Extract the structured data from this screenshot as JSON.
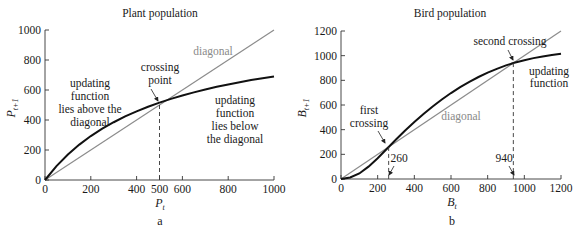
{
  "colors": {
    "curve": "#111111",
    "diagonal": "#8c8c8c",
    "axis": "#333333",
    "dashed": "#333333"
  },
  "chart_data": [
    {
      "type": "line",
      "panel": "a",
      "title": "Plant population",
      "xlabel": "P_t",
      "xlabel_main": "P",
      "xlabel_sub": "t",
      "ylabel": "P_{t+1}",
      "ylabel_main": "P",
      "ylabel_sub": "t+1",
      "xlim": [
        0,
        1000
      ],
      "ylim": [
        0,
        1000
      ],
      "xticks": [
        0,
        200,
        400,
        500,
        600,
        800,
        1000
      ],
      "yticks": [
        0,
        200,
        400,
        600,
        800,
        1000
      ],
      "grid": false,
      "series": [
        {
          "name": "updating function",
          "x": [
            0,
            50,
            100,
            150,
            200,
            250,
            300,
            350,
            400,
            450,
            500,
            550,
            600,
            650,
            700,
            750,
            800,
            850,
            900,
            950,
            1000
          ],
          "values": [
            0,
            93,
            170,
            236,
            293,
            342,
            385,
            424,
            458,
            488,
            516,
            541,
            563,
            584,
            603,
            621,
            637,
            652,
            666,
            678,
            690
          ]
        },
        {
          "name": "diagonal",
          "x": [
            0,
            1000
          ],
          "values": [
            0,
            1000
          ]
        }
      ],
      "crossings": [
        {
          "x": 500,
          "y": 500,
          "label": "crossing point"
        }
      ],
      "annotations": {
        "diagonal": "diagonal",
        "crossing": [
          "crossing",
          "point"
        ],
        "above": [
          "updating",
          "function",
          "lies above the",
          "diagonal"
        ],
        "below": [
          "updating",
          "function",
          "lies below",
          "the diagonal"
        ]
      },
      "panel_label": "a"
    },
    {
      "type": "line",
      "panel": "b",
      "title": "Bird population",
      "xlabel": "B_t",
      "xlabel_main": "B",
      "xlabel_sub": "t",
      "ylabel": "B_{t+1}",
      "ylabel_main": "B",
      "ylabel_sub": "t+1",
      "xlim": [
        0,
        1200
      ],
      "ylim": [
        0,
        1200
      ],
      "xticks": [
        0,
        200,
        400,
        600,
        800,
        1000,
        1200
      ],
      "yticks": [
        0,
        200,
        400,
        600,
        800,
        1000,
        1200
      ],
      "grid": false,
      "series": [
        {
          "name": "updating function",
          "x": [
            0,
            50,
            100,
            150,
            200,
            260,
            300,
            350,
            400,
            450,
            500,
            550,
            600,
            650,
            700,
            750,
            800,
            850,
            900,
            940,
            1000,
            1050,
            1100,
            1150,
            1200
          ],
          "values": [
            0,
            12,
            45,
            100,
            168,
            260,
            320,
            393,
            462,
            527,
            588,
            645,
            697,
            745,
            788,
            827,
            862,
            893,
            921,
            940,
            963,
            980,
            994,
            1005,
            1015
          ]
        },
        {
          "name": "diagonal",
          "x": [
            0,
            1200
          ],
          "values": [
            0,
            1200
          ]
        }
      ],
      "crossings": [
        {
          "x": 260,
          "y": 260,
          "label": "first crossing"
        },
        {
          "x": 940,
          "y": 940,
          "label": "second crossing"
        }
      ],
      "annotations": {
        "diagonal": "diagonal",
        "first": [
          "first",
          "crossing"
        ],
        "second": "second crossing",
        "updating": [
          "updating",
          "function"
        ],
        "x1": "260",
        "x2": "940"
      },
      "panel_label": "b"
    }
  ]
}
